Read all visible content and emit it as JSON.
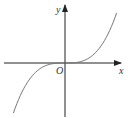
{
  "chart_data": {
    "type": "line",
    "title": "",
    "xlabel": "x",
    "ylabel": "y",
    "origin_label": "O",
    "function": "y = k·x^3 (odd cubic, passes through origin)",
    "xlim": [
      -1.4,
      1.4
    ],
    "ylim": [
      -1.4,
      1.4
    ],
    "grid": false,
    "legend": "none",
    "series": [
      {
        "name": "curve",
        "x": [
          -1.2,
          -1.0,
          -0.8,
          -0.6,
          -0.4,
          -0.2,
          0,
          0.2,
          0.4,
          0.6,
          0.8,
          1.0,
          1.2
        ],
        "values": [
          -1.2,
          -0.69,
          -0.36,
          -0.15,
          -0.044,
          -0.006,
          0,
          0.006,
          0.044,
          0.15,
          0.36,
          0.69,
          1.2
        ]
      }
    ],
    "colors": {
      "axis": "#222222",
      "curve": "#777777"
    }
  }
}
